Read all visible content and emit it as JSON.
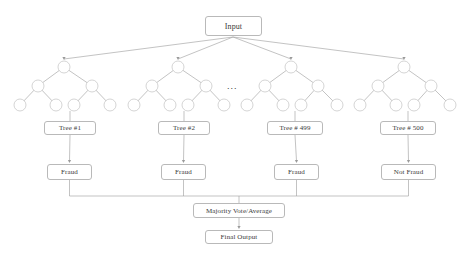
{
  "diagram": {
    "title_box": {
      "label": "Input",
      "x": 205,
      "y": 16,
      "w": 57,
      "h": 20,
      "font_size": 8
    },
    "ellipsis": {
      "label": "...",
      "x": 227,
      "y": 82,
      "font_size": 9
    },
    "colors": {
      "background": "#ffffff",
      "box_border": "#b9b9b9",
      "box_fill": "#ffffff",
      "text": "#3a3a3a",
      "edge": "#9a9a9a",
      "node_stroke": "#c2c2c2",
      "node_fill": "#ffffff"
    },
    "forest": {
      "node_radius": 6,
      "root_y": 67,
      "mid_y": 86,
      "leaf_y": 105,
      "trees": [
        {
          "root_x": 64,
          "mid_x": [
            38,
            92
          ],
          "leaf_x": [
            20,
            56,
            74,
            110
          ]
        },
        {
          "root_x": 178,
          "mid_x": [
            152,
            206
          ],
          "leaf_x": [
            134,
            170,
            188,
            224
          ]
        },
        {
          "root_x": 291,
          "mid_x": [
            265,
            318
          ],
          "leaf_x": [
            247,
            283,
            301,
            337
          ]
        },
        {
          "root_x": 404,
          "mid_x": [
            378,
            431
          ],
          "leaf_x": [
            360,
            396,
            414,
            450
          ]
        }
      ]
    },
    "tree_labels": [
      {
        "label": "Tree #1",
        "x": 44,
        "y": 121,
        "w": 52,
        "h": 14,
        "font_size": 7
      },
      {
        "label": "Tree #2",
        "x": 158,
        "y": 121,
        "w": 52,
        "h": 14,
        "font_size": 7
      },
      {
        "label": "Tree # 499",
        "x": 267,
        "y": 121,
        "w": 56,
        "h": 14,
        "font_size": 7
      },
      {
        "label": "Tree # 500",
        "x": 380,
        "y": 121,
        "w": 56,
        "h": 14,
        "font_size": 7
      }
    ],
    "predictions": [
      {
        "label": "Fraud",
        "x": 47,
        "y": 164,
        "w": 45,
        "h": 16,
        "font_size": 7
      },
      {
        "label": "Fraud",
        "x": 161,
        "y": 164,
        "w": 45,
        "h": 16,
        "font_size": 7
      },
      {
        "label": "Fraud",
        "x": 274,
        "y": 164,
        "w": 45,
        "h": 16,
        "font_size": 7
      },
      {
        "label": "Not Fraud",
        "x": 381,
        "y": 164,
        "w": 55,
        "h": 16,
        "font_size": 7
      }
    ],
    "aggregate": {
      "label": "Majority Vote/Average",
      "x": 193,
      "y": 203,
      "w": 92,
      "h": 15,
      "font_size": 7
    },
    "output": {
      "label": "Final Output",
      "x": 205,
      "y": 230,
      "w": 68,
      "h": 14,
      "font_size": 7
    },
    "bus_y": 196,
    "fan_origin": {
      "x": 233,
      "y": 37
    }
  }
}
